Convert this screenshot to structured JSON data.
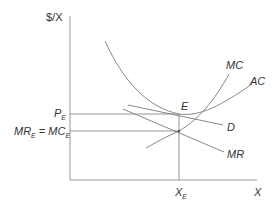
{
  "diagram": {
    "type": "economics-monopoly-equilibrium",
    "y_axis_label": "$/X",
    "x_axis_label": "X",
    "curves": [
      {
        "name": "MC",
        "label": "MC"
      },
      {
        "name": "AC",
        "label": "AC"
      },
      {
        "name": "D",
        "label": "D"
      },
      {
        "name": "MR",
        "label": "MR"
      }
    ],
    "equilibrium_point_label": "E",
    "price_label": {
      "main": "P",
      "sub": "E"
    },
    "mr_mc_label": {
      "mr": "MR",
      "mr_sub": "E",
      "eq": " = ",
      "mc": "MC",
      "mc_sub": "E"
    },
    "quantity_label": {
      "main": "X",
      "sub": "E"
    },
    "colors": {
      "axis": "#9a9a9a",
      "curve": "#7a7a7a",
      "text": "#333333",
      "background": "#ffffff"
    }
  }
}
